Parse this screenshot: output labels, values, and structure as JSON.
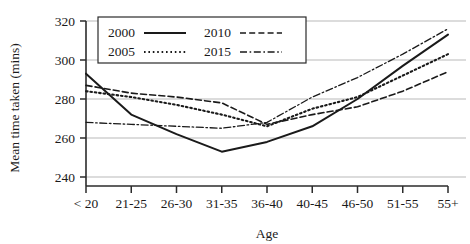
{
  "chart_data": {
    "type": "line",
    "title": "",
    "xlabel": "Age",
    "ylabel": "Mean time taken (mins)",
    "categories": [
      "< 20",
      "21-25",
      "26-30",
      "31-35",
      "36-40",
      "40-45",
      "46-50",
      "51-55",
      "55+"
    ],
    "ylim": [
      240,
      320
    ],
    "yticks": [
      240,
      260,
      280,
      300,
      320
    ],
    "grid": true,
    "legend_position": "top-left-inside",
    "series": [
      {
        "name": "2000",
        "style": "solid",
        "color": "#1a1a1a",
        "values": [
          293,
          272,
          262,
          253,
          258,
          266,
          280,
          297,
          313
        ]
      },
      {
        "name": "2005",
        "style": "dotted",
        "color": "#1a1a1a",
        "values": [
          284,
          281,
          277,
          272,
          266,
          275,
          281,
          292,
          303
        ]
      },
      {
        "name": "2010",
        "style": "dashed",
        "color": "#1a1a1a",
        "values": [
          287,
          283,
          281,
          278,
          267,
          272,
          276,
          284,
          294
        ]
      },
      {
        "name": "2015",
        "style": "dash-dot",
        "color": "#1a1a1a",
        "values": [
          268,
          267,
          266,
          265,
          268,
          281,
          291,
          303,
          316
        ]
      }
    ]
  },
  "axis": {
    "y_label": "Mean time taken (mins)",
    "x_label": "Age",
    "y_ticks": [
      "320",
      "300",
      "280",
      "260",
      "240"
    ],
    "x_ticks": [
      "< 20",
      "21-25",
      "26-30",
      "31-35",
      "36-40",
      "40-45",
      "46-50",
      "51-55",
      "55+"
    ]
  },
  "legend": {
    "entries": [
      {
        "label": "2000",
        "style": "solid"
      },
      {
        "label": "2010",
        "style": "dashed"
      },
      {
        "label": "2005",
        "style": "dotted"
      },
      {
        "label": "2015",
        "style": "dash-dot"
      }
    ]
  }
}
